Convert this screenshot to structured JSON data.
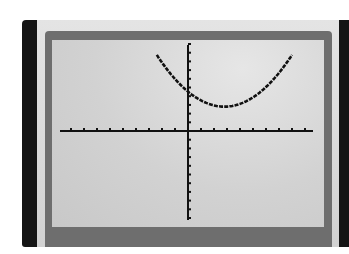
{
  "device": {
    "type": "graphing-calculator-screen",
    "colors": {
      "bezel": "#151515",
      "outer_frame": "#dcdcdc",
      "border": "#6e6e6e",
      "lcd": "#d6d6d6",
      "ink": "#111111"
    }
  },
  "chart_data": {
    "type": "line",
    "title": "",
    "xlabel": "",
    "ylabel": "",
    "grid": false,
    "legend": null,
    "axes": {
      "x_ticks_left": 9,
      "x_ticks_right": 9,
      "y_ticks_up": 10,
      "y_ticks_down": 10,
      "xlim": [
        -9.5,
        9.5
      ],
      "ylim": [
        -10,
        10
      ]
    },
    "series": [
      {
        "name": "parabola",
        "equation_estimate": "y = 0.22(x - 2.8)^2 + 2.8",
        "x": [
          -2.4,
          -1,
          0,
          1,
          2,
          2.8,
          4,
          5,
          6,
          7,
          8
        ],
        "y": [
          9.8,
          6.0,
          4.9,
          3.7,
          3.0,
          2.8,
          3.1,
          3.9,
          5.1,
          6.6,
          9.8
        ]
      }
    ]
  }
}
